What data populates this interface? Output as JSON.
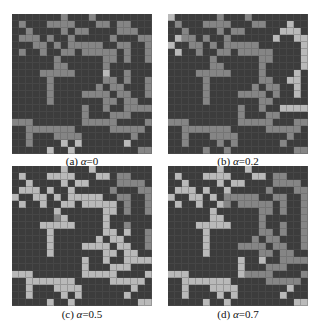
{
  "figure": {
    "cell_colors": {
      "0": "#3c3c3c",
      "1": "#858585",
      "2": "#b9b9b9"
    },
    "panels": [
      {
        "id": "a",
        "label": "(a)",
        "param_symbol": "α",
        "param_value": "=0",
        "rows": [
          "00000001000100000000",
          "01000111100011011000",
          "00100001011000011100",
          "01110100100000100011",
          "00011010111110011001",
          "01001001101111101001",
          "00000010000001101001",
          "00000011000001000000",
          "00001111100002001000",
          "00000100000001101001",
          "00000100000010110001",
          "00000100001111011001",
          "00000100000001101100",
          "00000000001001001111",
          "00000000001000111000",
          "11100000001111100001",
          "00111111100000111110",
          "00100011110000000100",
          "00100002020000002000",
          "00000200200000000011"
        ]
      },
      {
        "id": "b",
        "label": "(b)",
        "param_symbol": "α",
        "param_value": "=0.2",
        "rows": [
          "20000001000100000000",
          "01000111100011000200",
          "00100001011000002220",
          "02110100100000020022",
          "20011010111110000002",
          "02001001101111100002",
          "00000010000001100002",
          "00000011000001000002",
          "00001111100001000020",
          "00000100000001100220",
          "00000100000010110020",
          "00000100001111010020",
          "00000100000001100000",
          "00000000001001002222",
          "00000000001000110000",
          "11100000001111100011",
          "00111111100000111110",
          "00100011110000000100",
          "00100001010000001000",
          "00000100100000000011"
        ]
      },
      {
        "id": "c",
        "label": "(c)",
        "param_symbol": "α",
        "param_value": "=0.5",
        "rows": [
          "00000002000200000000",
          "02000222200022011000",
          "00200002022000011110",
          "02220200200000100011",
          "20022020222220011001",
          "02002002202222201001",
          "00000020000002201001",
          "00000012000002000000",
          "00002222200002001000",
          "00000200000002202001",
          "00000200000020220001",
          "00000200002222022001",
          "00000200000002202200",
          "00000000002002002222",
          "00000000002000222000",
          "22200000002222200002",
          "00222222200000222220",
          "00200022220000000200",
          "00200002020000002000",
          "00000200200000000022"
        ]
      },
      {
        "id": "d",
        "label": "(d)",
        "param_symbol": "α",
        "param_value": "=0.7",
        "rows": [
          "00000002000200000000",
          "02000222200022011000",
          "00200002022000011110",
          "02220200200000100011",
          "20022020111110011001",
          "02002002101111101001",
          "00000020000001101001",
          "00000022000001000001",
          "00002222200001001001",
          "00000200000001101001",
          "00000200000010110001",
          "00000200001111011001",
          "00000200000001101100",
          "00000000002002001111",
          "00000000002000111000",
          "22200000002111100001",
          "00222222200000111110",
          "00200022220000000200",
          "00200002020000002000",
          "00000200200000000022"
        ]
      }
    ]
  }
}
